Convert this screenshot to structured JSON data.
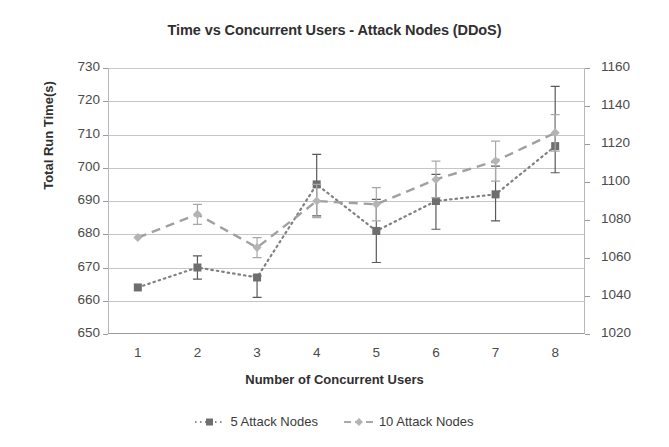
{
  "chart_data": {
    "type": "line",
    "title": "Time vs Concurrent Users - Attack Nodes (DDoS)",
    "xlabel": "Number of Concurrent Users",
    "ylabel": "Total Run Time(s)",
    "y2label": "",
    "grid": true,
    "legend_position": "bottom",
    "x": [
      1,
      2,
      3,
      4,
      5,
      6,
      7,
      8
    ],
    "xticklabels": [
      "1",
      "2",
      "3",
      "4",
      "5",
      "6",
      "7",
      "8"
    ],
    "ylim": [
      650,
      730
    ],
    "yticks": [
      650,
      660,
      670,
      680,
      690,
      700,
      710,
      720,
      730
    ],
    "yticklabels": [
      "650",
      "660",
      "670",
      "680",
      "690",
      "700",
      "710",
      "720",
      "730"
    ],
    "y2lim": [
      1020,
      1160
    ],
    "y2ticks": [
      1020,
      1040,
      1060,
      1080,
      1100,
      1120,
      1140,
      1160
    ],
    "y2ticklabels": [
      "1020",
      "1040",
      "1060",
      "1080",
      "1100",
      "1120",
      "1140",
      "1160"
    ],
    "series": [
      {
        "name": "5 Attack Nodes",
        "axis": "left",
        "linestyle": "dotted",
        "marker": "square",
        "color": "#808080",
        "values": [
          664,
          670,
          667,
          695,
          681,
          690,
          692,
          706.5
        ],
        "err_low": [
          664,
          666.5,
          661,
          685.5,
          671.5,
          681.5,
          684,
          698.5
        ],
        "err_high": [
          664,
          673.5,
          667.5,
          704,
          690.5,
          698,
          700.5,
          724.5
        ]
      },
      {
        "name": "10 Attack Nodes",
        "axis": "right",
        "linestyle": "dashed",
        "marker": "diamond",
        "color": "#a0a0a0",
        "values": [
          1070,
          1082,
          1064,
          1088,
          1086,
          1101,
          1110,
          1125
        ],
        "values_left_scale": [
          679,
          686,
          676,
          690,
          689,
          696.5,
          702,
          710.5
        ],
        "err_low_left_scale": [
          679,
          683,
          673,
          685,
          684,
          691,
          696,
          705
        ],
        "err_high_left_scale": [
          679,
          689,
          679,
          695,
          694,
          702,
          708,
          716
        ]
      }
    ]
  },
  "legend": {
    "items": [
      {
        "label": "5 Attack Nodes",
        "marker": "square-marker-icon",
        "linestyle": "dotted"
      },
      {
        "label": "10 Attack Nodes",
        "marker": "diamond-marker-icon",
        "linestyle": "dashed"
      }
    ]
  },
  "colors": {
    "series_5_nodes": "#808080",
    "series_10_nodes": "#a0a0a0",
    "grid": "#c6c6c6",
    "axis": "#9a9a9a",
    "text": "#3a3a3a"
  }
}
